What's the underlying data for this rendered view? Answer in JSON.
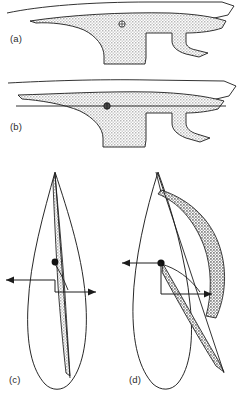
{
  "figure": {
    "background_color": "#ffffff",
    "ink_color": "#1c1c1c",
    "stipple_light_color": "#c9c9c9",
    "stipple_dark_color": "#8f8f8f"
  },
  "panels": [
    {
      "id": "a",
      "label": "(a)",
      "caption_position": "left",
      "view": "hull-profile-upright",
      "shaded_region": "lateral-plane-area",
      "shading": "light-stipple",
      "marker": "centre-of-lateral-resistance",
      "marker_symbol": "circle-crosshair",
      "waterline_visible": false
    },
    {
      "id": "b",
      "label": "(b)",
      "caption_position": "left",
      "view": "hull-profile-with-waterline",
      "shaded_region": "lateral-plane-area",
      "shading": "light-stipple",
      "marker": "centre-of-lateral-resistance",
      "marker_symbol": "circle-crosshair",
      "waterline_visible": true
    },
    {
      "id": "c",
      "label": "(c)",
      "caption_position": "left",
      "view": "stern-view-upright",
      "shaded_region": "sail-area",
      "shading": "light-stipple",
      "marker": "centre-of-effort",
      "marker_symbol": "filled-dot",
      "force_couple": {
        "upper_arrow_direction": "left",
        "lower_arrow_direction": "right",
        "offset": "small",
        "heel_angle_deg": 0
      }
    },
    {
      "id": "d",
      "label": "(d)",
      "caption_position": "left",
      "view": "stern-view-heeled",
      "shaded_region": "sail-area",
      "shading": "dark-stipple",
      "marker": "centre-of-effort",
      "marker_symbol": "filled-dot",
      "force_couple": {
        "upper_arrow_direction": "left",
        "lower_arrow_direction": "right",
        "offset": "large",
        "heel_angle_deg": 30
      }
    }
  ]
}
